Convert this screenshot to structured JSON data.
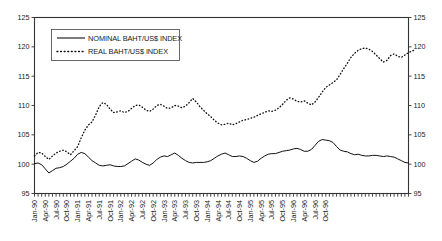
{
  "chart_data": {
    "type": "line",
    "title": "",
    "xlabel": "",
    "ylabel": "",
    "ylim": [
      95,
      125
    ],
    "ytick_labels": [
      "95",
      "100",
      "105",
      "110",
      "115",
      "120",
      "125"
    ],
    "yticks": [
      95,
      100,
      105,
      110,
      115,
      120,
      125
    ],
    "grid": false,
    "dual_y_axis": true,
    "legend_position": "upper-left-inside",
    "x_tick_interval_months": 1,
    "x_label_interval_months": 3,
    "x_start": "Jan-90",
    "x_end": "Oct-96",
    "xtick_labels": [
      "Jan-90",
      "Apr-90",
      "Jul-90",
      "Oct-90",
      "Jan-91",
      "Apr-91",
      "Jul-91",
      "Oct-91",
      "Jan-92",
      "Apr-92",
      "Jul-92",
      "Oct-92",
      "Jan-93",
      "Apr-93",
      "Jul-93",
      "Oct-93",
      "Jan-94",
      "Apr-94",
      "Jul-94",
      "Oct-94",
      "Jan-95",
      "Apr-95",
      "Jul-95",
      "Oct-95",
      "Jan-96",
      "Apr-96",
      "Jul-96",
      "Oct-96"
    ],
    "series": [
      {
        "name": "NOMINAL BAHT/US$ INDEX",
        "style": "solid",
        "values": [
          100.1,
          100.2,
          99.9,
          99.2,
          98.5,
          98.9,
          99.3,
          99.4,
          99.6,
          100.0,
          100.5,
          101.0,
          101.7,
          102.0,
          101.8,
          101.2,
          100.6,
          100.2,
          99.8,
          99.7,
          99.8,
          99.9,
          99.7,
          99.6,
          99.6,
          99.7,
          100.1,
          100.5,
          100.9,
          100.7,
          100.3,
          100.0,
          99.8,
          100.2,
          100.8,
          101.2,
          101.4,
          101.3,
          101.6,
          101.9,
          101.5,
          101.0,
          100.6,
          100.3,
          100.2,
          100.3,
          100.3,
          100.3,
          100.4,
          100.6,
          101.0,
          101.4,
          101.7,
          101.9,
          101.6,
          101.3,
          101.3,
          101.4,
          101.3,
          101.0,
          100.6,
          100.3,
          100.5,
          101.0,
          101.4,
          101.7,
          101.8,
          101.8,
          102.0,
          102.2,
          102.3,
          102.4,
          102.6,
          102.7,
          102.5,
          102.2,
          102.2,
          102.5,
          103.2,
          103.9,
          104.2,
          104.1,
          104.0,
          103.7,
          103.0,
          102.4,
          102.2,
          102.1,
          101.8,
          101.6,
          101.7,
          101.5,
          101.4,
          101.4,
          101.5,
          101.5,
          101.4,
          101.3,
          101.4,
          101.3,
          101.2,
          100.9,
          100.6,
          100.3,
          100.2
        ]
      },
      {
        "name": "REAL BAHT/US$ INDEX",
        "style": "dotted",
        "values": [
          101.4,
          102.0,
          101.9,
          101.3,
          100.8,
          101.4,
          101.9,
          102.2,
          102.4,
          102.1,
          101.6,
          102.3,
          103.0,
          104.5,
          105.8,
          106.7,
          107.2,
          108.4,
          109.8,
          110.5,
          110.2,
          109.4,
          108.8,
          108.9,
          109.1,
          108.8,
          109.0,
          109.5,
          110.0,
          110.1,
          109.7,
          109.2,
          109.0,
          109.4,
          110.0,
          110.2,
          109.9,
          109.5,
          109.6,
          110.0,
          109.9,
          109.6,
          109.9,
          110.5,
          111.2,
          110.6,
          109.8,
          109.2,
          108.6,
          108.1,
          107.5,
          107.0,
          106.7,
          106.8,
          107.0,
          106.7,
          106.9,
          107.2,
          107.5,
          107.6,
          107.8,
          108.0,
          108.3,
          108.6,
          108.8,
          109.1,
          109.0,
          109.2,
          109.6,
          110.2,
          110.9,
          111.3,
          111.1,
          110.7,
          110.6,
          110.8,
          110.4,
          110.1,
          110.6,
          111.4,
          112.3,
          113.1,
          113.5,
          113.9,
          114.4,
          115.3,
          116.3,
          117.2,
          118.2,
          118.9,
          119.4,
          119.7,
          119.8,
          119.6,
          119.2,
          118.6,
          118.0,
          117.4,
          117.7,
          118.5,
          118.8,
          118.4,
          118.2,
          118.6,
          119.0,
          119.3,
          119.5
        ]
      }
    ]
  },
  "legend": {
    "items": [
      {
        "label": "NOMINAL BAHT/US$ INDEX",
        "style": "solid"
      },
      {
        "label": "REAL BAHT/US$ INDEX",
        "style": "dotted"
      }
    ]
  }
}
